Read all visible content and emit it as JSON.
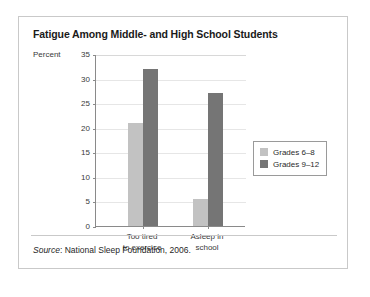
{
  "figure": {
    "title": "Fatigue Among Middle- and High School Students",
    "source_word": "Source",
    "source_rest": ": National Sleep Foundation, 2006."
  },
  "chart_data": {
    "type": "bar",
    "title": "Fatigue Among Middle- and High School Students",
    "xlabel": "",
    "ylabel": "Percent",
    "ylim": [
      0,
      35
    ],
    "yticks": [
      "0",
      "5",
      "10",
      "15",
      "20",
      "25",
      "30",
      "35"
    ],
    "ytick_values": [
      0,
      5,
      10,
      15,
      20,
      25,
      30,
      35
    ],
    "grid": true,
    "legend_position": "right",
    "categories": [
      "Too tired to exercise",
      "Asleep in school"
    ],
    "category_lines": [
      [
        "Too tired",
        "to exercise"
      ],
      [
        "Asleep in",
        "school"
      ]
    ],
    "series": [
      {
        "name": "Grades 6–8",
        "color": "#c2c2c2",
        "values": [
          21,
          5.5
        ]
      },
      {
        "name": "Grades 9–12",
        "color": "#757575",
        "values": [
          32,
          27
        ]
      }
    ]
  }
}
